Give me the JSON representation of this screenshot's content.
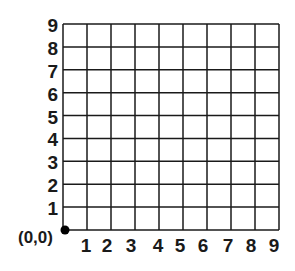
{
  "diagram": {
    "type": "coordinate-grid",
    "columns": 9,
    "rows": 9,
    "grid_color": "#1a1a1a",
    "origin_label": "(0,0)",
    "y_labels": [
      "1",
      "2",
      "3",
      "4",
      "5",
      "6",
      "7",
      "8",
      "9"
    ],
    "x_labels": [
      "1",
      "2",
      "3",
      "4",
      "5",
      "6",
      "7",
      "8",
      "9"
    ]
  }
}
